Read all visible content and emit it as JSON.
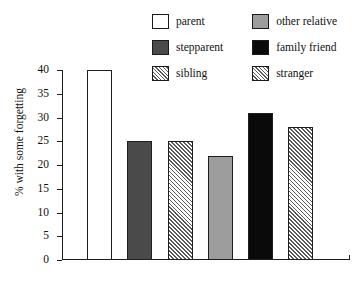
{
  "chart_data": {
    "type": "bar",
    "title": "",
    "xlabel": "",
    "ylabel": "% with some forgetting",
    "ylim": [
      0,
      40
    ],
    "ytick_step": 5,
    "yticks": [
      "40",
      "35",
      "30",
      "25",
      "20",
      "15",
      "10",
      "5",
      "0"
    ],
    "grid": false,
    "xtick_labels_shown": false,
    "legend_position": "top",
    "categories": [
      "parent",
      "stepparent",
      "sibling",
      "other relative",
      "family friend",
      "stranger"
    ],
    "values": [
      40,
      25,
      25,
      22,
      31,
      28
    ],
    "bars": [
      {
        "label": "parent",
        "value": 40,
        "style": "white"
      },
      {
        "label": "stepparent",
        "value": 25,
        "style": "dark-gray"
      },
      {
        "label": "sibling",
        "value": 25,
        "style": "diagonal-hatch"
      },
      {
        "label": "other relative",
        "value": 22,
        "style": "medium-gray"
      },
      {
        "label": "family friend",
        "value": 31,
        "style": "black"
      },
      {
        "label": "stranger",
        "value": 28,
        "style": "diagonal-hatch"
      }
    ]
  },
  "legend": {
    "items": [
      {
        "label": "parent",
        "style": "white",
        "swatch_color": "#ffffff"
      },
      {
        "label": "other relative",
        "style": "medium-gray",
        "swatch_color": "#9d9d9d"
      },
      {
        "label": "stepparent",
        "style": "dark-gray",
        "swatch_color": "#4a4a4a"
      },
      {
        "label": "family friend",
        "style": "black",
        "swatch_color": "#0a0a0a"
      },
      {
        "label": "sibling",
        "style": "diagonal-hatch",
        "swatch_color": "#5b5b5b"
      },
      {
        "label": "stranger",
        "style": "diagonal-hatch",
        "swatch_color": "#5b5b5b"
      }
    ]
  },
  "axes": {
    "y_label": "% with some forgetting",
    "y_ticks": [
      "40",
      "35",
      "30",
      "25",
      "20",
      "15",
      "10",
      "5",
      "0"
    ],
    "axis_color": "#1f1f1f"
  }
}
